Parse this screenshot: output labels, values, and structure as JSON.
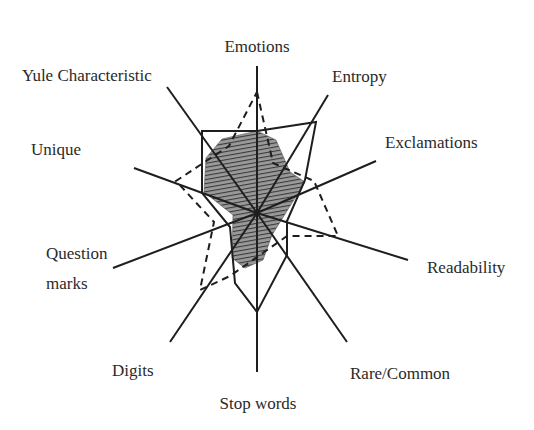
{
  "chart_data": {
    "type": "radar",
    "title": "",
    "center": [
      257,
      213
    ],
    "axes": [
      {
        "name": "Emotions",
        "end": [
          257,
          66
        ],
        "label_pos": [
          257,
          52
        ],
        "anchor": "middle"
      },
      {
        "name": "Entropy",
        "end": [
          328,
          95
        ],
        "label_pos": [
          332,
          82
        ],
        "anchor": "start"
      },
      {
        "name": "Exclamations",
        "end": [
          376,
          161
        ],
        "label_pos": [
          385,
          148
        ],
        "anchor": "start"
      },
      {
        "name": "Readability",
        "end": [
          408,
          260
        ],
        "label_pos": [
          427,
          273
        ],
        "anchor": "start"
      },
      {
        "name": "Rare/Common",
        "end": [
          347,
          342
        ],
        "label_pos": [
          350,
          379
        ],
        "anchor": "start"
      },
      {
        "name": "Stop words",
        "end": [
          257,
          372
        ],
        "label_pos": [
          258,
          409
        ],
        "anchor": "middle"
      },
      {
        "name": "Digits",
        "end": [
          170,
          342
        ],
        "label_pos": [
          112,
          376
        ],
        "anchor": "start"
      },
      {
        "name": "Question marks",
        "end": [
          113,
          268
        ],
        "label_pos": [
          46,
          259
        ],
        "anchor": "start",
        "second_line": "marks",
        "second_pos": [
          46,
          289
        ]
      },
      {
        "name": "Unique",
        "end": [
          134,
          168
        ],
        "label_pos": [
          31,
          155
        ],
        "anchor": "start"
      },
      {
        "name": "Yule Characteristic",
        "end": [
          167,
          87
        ],
        "label_pos": [
          22,
          81
        ],
        "anchor": "start"
      }
    ],
    "series": [
      {
        "name": "solid-profile",
        "style": "solid",
        "points": [
          [
            257,
            131
          ],
          [
            316,
            122
          ],
          [
            305,
            180
          ],
          [
            287,
            221
          ],
          [
            287,
            255
          ],
          [
            257,
            312
          ],
          [
            235,
            283
          ],
          [
            230,
            227
          ],
          [
            202,
            193
          ],
          [
            202,
            131
          ]
        ]
      },
      {
        "name": "dashed-profile",
        "style": "dashed",
        "points": [
          [
            257,
            92
          ],
          [
            273,
            163
          ],
          [
            314,
            181
          ],
          [
            338,
            236
          ],
          [
            287,
            236
          ],
          [
            230,
            276
          ],
          [
            200,
            290
          ],
          [
            214,
            222
          ],
          [
            176,
            181
          ],
          [
            229,
            146
          ]
        ]
      },
      {
        "name": "shaded-profile",
        "style": "hatched-fill",
        "points": [
          [
            257,
            131
          ],
          [
            276,
            140
          ],
          [
            290,
            172
          ],
          [
            305,
            182
          ],
          [
            290,
            206
          ],
          [
            272,
            235
          ],
          [
            263,
            260
          ],
          [
            245,
            268
          ],
          [
            232,
            258
          ],
          [
            233,
            215
          ],
          [
            204,
            192
          ],
          [
            206,
            158
          ],
          [
            222,
            139
          ]
        ]
      }
    ],
    "legend": [],
    "grid": false
  }
}
